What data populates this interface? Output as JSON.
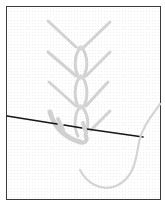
{
  "figure": {
    "description": "Embroidery stitch illustration: a vertical chain of looped feather-style stitches with diagonal arms, a needle passing through the bottom loop, and a working thread curving off to the right.",
    "colors": {
      "background": "#ffffff",
      "frame_border": "#3a3a3a",
      "thread": "#d2d2d2",
      "thread_shadow": "#c4c4c4",
      "needle": "#151515"
    },
    "stitch_rows": 4,
    "elements": [
      "frame",
      "stitch-arms",
      "chain-loops",
      "needle",
      "working-thread"
    ]
  }
}
